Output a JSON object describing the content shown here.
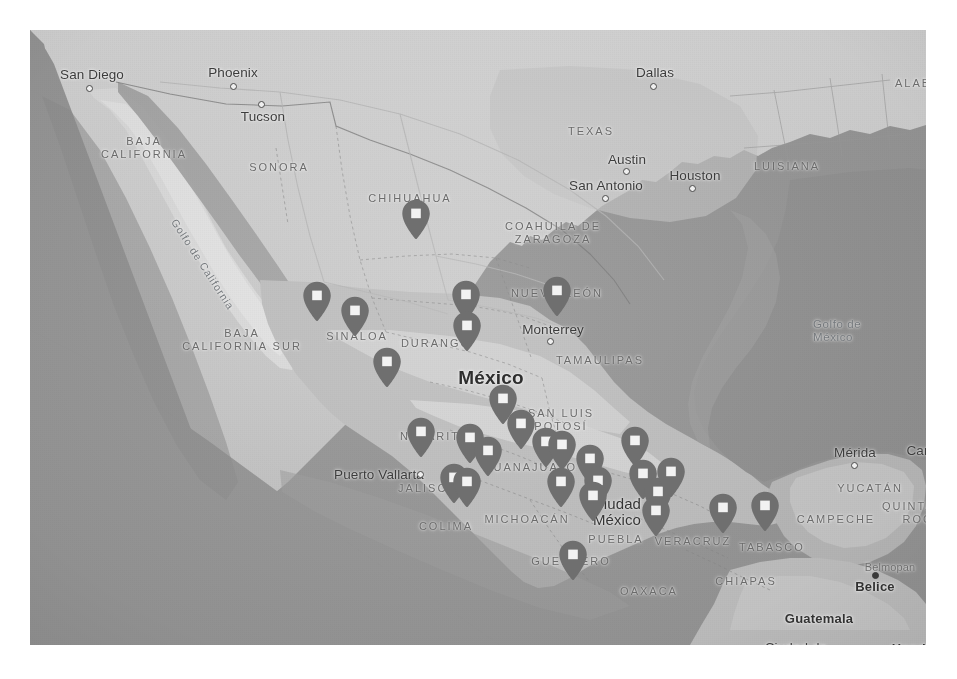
{
  "view": {
    "background": "#ffffff",
    "map_bounds": {
      "left": 30,
      "top": 30,
      "width": 896,
      "height": 615
    },
    "ocean_color": "#999999",
    "land_color": "#c9c9c9",
    "land_light_color": "#dcdcdc",
    "marker_color": "#6f6f6f",
    "marker_inner_color": "#f2f2f2"
  },
  "map": {
    "title": "Mexico locations map",
    "country_focus": "México",
    "water_labels": [
      {
        "name": "gulf-of-california",
        "text": "Golfo de California",
        "x": 150,
        "y": 186,
        "rotated": true
      },
      {
        "name": "gulf-of-mexico-line1",
        "text": "Golfo de",
        "x": 783,
        "y": 287,
        "rotated": false
      },
      {
        "name": "gulf-of-mexico-line2",
        "text": "México",
        "x": 783,
        "y": 300,
        "rotated": false
      }
    ],
    "country_labels": [
      {
        "name": "country-belize",
        "text": "Belice",
        "x": 845,
        "y": 556
      },
      {
        "name": "country-guatemala",
        "text": "Guatemala",
        "x": 789,
        "y": 588
      },
      {
        "name": "country-honduras",
        "text": "Honduras",
        "x": 893,
        "y": 618
      }
    ],
    "country_focus_label": {
      "name": "country-mexico",
      "text": "México",
      "x": 461,
      "y": 348
    },
    "state_labels": [
      {
        "name": "state-baja-california",
        "lines": [
          "BAJA",
          "CALIFORNIA"
        ],
        "x": 114,
        "y": 118
      },
      {
        "name": "state-sonora",
        "lines": [
          "SONORA"
        ],
        "x": 249,
        "y": 137
      },
      {
        "name": "state-chihuahua",
        "lines": [
          "CHIHUAHUA"
        ],
        "x": 380,
        "y": 168
      },
      {
        "name": "state-coahuila-de-zaragoza",
        "lines": [
          "COAHUILA DE",
          "ZARAGOZA"
        ],
        "x": 523,
        "y": 203
      },
      {
        "name": "state-nuevo-leon",
        "lines": [
          "NUEVO LEÓN"
        ],
        "x": 527,
        "y": 263
      },
      {
        "name": "state-baja-california-sur",
        "lines": [
          "BAJA",
          "CALIFORNIA SUR"
        ],
        "x": 212,
        "y": 310
      },
      {
        "name": "state-sinaloa",
        "lines": [
          "SINALOA"
        ],
        "x": 327,
        "y": 306
      },
      {
        "name": "state-durango",
        "lines": [
          "DURANGO"
        ],
        "x": 406,
        "y": 313
      },
      {
        "name": "state-tamaulipas",
        "lines": [
          "TAMAULIPAS"
        ],
        "x": 570,
        "y": 330
      },
      {
        "name": "state-nayarit",
        "lines": [
          "NAYARIT"
        ],
        "x": 400,
        "y": 406
      },
      {
        "name": "state-san-luis-potosi",
        "lines": [
          "SAN LUIS",
          "POTOSÍ"
        ],
        "x": 531,
        "y": 390
      },
      {
        "name": "state-guanajuato",
        "lines": [
          "GUANAJUATO"
        ],
        "x": 500,
        "y": 437
      },
      {
        "name": "state-jalisco",
        "lines": [
          "JALISCO"
        ],
        "x": 398,
        "y": 458
      },
      {
        "name": "state-colima",
        "lines": [
          "COLIMA"
        ],
        "x": 416,
        "y": 496
      },
      {
        "name": "state-michoacan",
        "lines": [
          "MICHOACÁN"
        ],
        "x": 497,
        "y": 489
      },
      {
        "name": "state-puebla",
        "lines": [
          "PUEBLA"
        ],
        "x": 586,
        "y": 509
      },
      {
        "name": "state-veracruz",
        "lines": [
          "VERACRUZ"
        ],
        "x": 663,
        "y": 511
      },
      {
        "name": "state-tabasco",
        "lines": [
          "TABASCO"
        ],
        "x": 742,
        "y": 517
      },
      {
        "name": "state-guerrero",
        "lines": [
          "GUERRERO"
        ],
        "x": 541,
        "y": 531
      },
      {
        "name": "state-oaxaca",
        "lines": [
          "OAXACA"
        ],
        "x": 619,
        "y": 561
      },
      {
        "name": "state-chiapas",
        "lines": [
          "CHIAPAS"
        ],
        "x": 716,
        "y": 551
      },
      {
        "name": "state-campeche",
        "lines": [
          "CAMPECHE"
        ],
        "x": 806,
        "y": 489
      },
      {
        "name": "state-yucatan",
        "lines": [
          "YUCATÁN"
        ],
        "x": 840,
        "y": 458
      },
      {
        "name": "state-quintana-roo",
        "lines": [
          "QUINTANA",
          "ROO"
        ],
        "x": 888,
        "y": 483
      },
      {
        "name": "state-texas",
        "lines": [
          "TEXAS"
        ],
        "x": 561,
        "y": 101
      },
      {
        "name": "state-luisiana",
        "lines": [
          "LUISIANA"
        ],
        "x": 757,
        "y": 136
      },
      {
        "name": "state-alabama",
        "lines": [
          "ALABAMA"
        ],
        "x": 898,
        "y": 53
      }
    ],
    "city_labels": [
      {
        "name": "city-san-diego",
        "text": "San Diego",
        "x": 62,
        "y": 44,
        "dot_x": 59,
        "dot_y": 58,
        "size": "city"
      },
      {
        "name": "city-phoenix",
        "text": "Phoenix",
        "x": 203,
        "y": 42,
        "dot_x": 203,
        "dot_y": 56,
        "size": "city"
      },
      {
        "name": "city-tucson",
        "text": "Tucson",
        "x": 233,
        "y": 86,
        "dot_x": 231,
        "dot_y": 74,
        "size": "city"
      },
      {
        "name": "city-dallas",
        "text": "Dallas",
        "x": 625,
        "y": 42,
        "dot_x": 623,
        "dot_y": 56,
        "size": "city"
      },
      {
        "name": "city-austin",
        "text": "Austin",
        "x": 597,
        "y": 129,
        "dot_x": 596,
        "dot_y": 141,
        "size": "city"
      },
      {
        "name": "city-san-antonio",
        "text": "San Antonio",
        "x": 576,
        "y": 155,
        "dot_x": 575,
        "dot_y": 168,
        "size": "city"
      },
      {
        "name": "city-houston",
        "text": "Houston",
        "x": 665,
        "y": 145,
        "dot_x": 662,
        "dot_y": 158,
        "size": "city"
      },
      {
        "name": "city-monterrey",
        "text": "Monterrey",
        "x": 523,
        "y": 299,
        "dot_x": 520,
        "dot_y": 311,
        "size": "city"
      },
      {
        "name": "city-puerto-vallarta",
        "text": "Puerto Vallarta",
        "x": 349,
        "y": 444,
        "dot_x": 390,
        "dot_y": 444,
        "size": "city"
      },
      {
        "name": "city-merida",
        "text": "Mérida",
        "x": 825,
        "y": 422,
        "dot_x": 824,
        "dot_y": 435,
        "size": "city"
      },
      {
        "name": "city-cancun",
        "text": "Cancún",
        "x": 900,
        "y": 420,
        "dot_x": 899,
        "dot_y": 432,
        "size": "city"
      },
      {
        "name": "city-belmopan",
        "text": "Belmopan",
        "x": 860,
        "y": 537,
        "dot_x": 845,
        "dot_y": 545,
        "size": "small-faint"
      },
      {
        "name": "city-ciudad-de-mexico-l1",
        "text": "Ciudad",
        "x": 587,
        "y": 473,
        "size": "city-mid"
      },
      {
        "name": "city-ciudad-de-mexico-l2",
        "text": "México",
        "x": 587,
        "y": 489,
        "size": "city-mid"
      },
      {
        "name": "city-ciudad-de-guatemala-l1",
        "text": "Ciudad de",
        "x": 766,
        "y": 617,
        "size": "city"
      },
      {
        "name": "city-ciudad-de-guatemala-l2",
        "text": "Guatemala",
        "x": 766,
        "y": 633,
        "size": "city"
      }
    ],
    "markers": [
      {
        "name": "map-marker",
        "id": 1,
        "x": 386,
        "y": 210,
        "region": "Chihuahua"
      },
      {
        "name": "map-marker",
        "id": 2,
        "x": 287,
        "y": 292,
        "region": "Sinaloa-north"
      },
      {
        "name": "map-marker",
        "id": 3,
        "x": 436,
        "y": 291,
        "region": "Durango-east"
      },
      {
        "name": "map-marker",
        "id": 4,
        "x": 527,
        "y": 287,
        "region": "Monterrey"
      },
      {
        "name": "map-marker",
        "id": 5,
        "x": 325,
        "y": 307,
        "region": "Sinaloa"
      },
      {
        "name": "map-marker",
        "id": 6,
        "x": 437,
        "y": 322,
        "region": "Durango"
      },
      {
        "name": "map-marker",
        "id": 7,
        "x": 357,
        "y": 358,
        "region": "Sinaloa-south"
      },
      {
        "name": "map-marker",
        "id": 8,
        "x": 473,
        "y": 395,
        "region": "Zacatecas"
      },
      {
        "name": "map-marker",
        "id": 9,
        "x": 491,
        "y": 420,
        "region": "San Luis Potosí"
      },
      {
        "name": "map-marker",
        "id": 10,
        "x": 391,
        "y": 428,
        "region": "Nayarit"
      },
      {
        "name": "map-marker",
        "id": 11,
        "x": 440,
        "y": 434,
        "region": "Jalisco-north"
      },
      {
        "name": "map-marker",
        "id": 12,
        "x": 458,
        "y": 447,
        "region": "Guanajuato-west"
      },
      {
        "name": "map-marker",
        "id": 13,
        "x": 516,
        "y": 438,
        "region": "Guanajuato"
      },
      {
        "name": "map-marker",
        "id": 14,
        "x": 532,
        "y": 441,
        "region": "Guanajuato-east"
      },
      {
        "name": "map-marker",
        "id": 15,
        "x": 605,
        "y": 437,
        "region": "Hidalgo"
      },
      {
        "name": "map-marker",
        "id": 16,
        "x": 424,
        "y": 474,
        "region": "Jalisco"
      },
      {
        "name": "map-marker",
        "id": 17,
        "x": 437,
        "y": 478,
        "region": "Colima"
      },
      {
        "name": "map-marker",
        "id": 18,
        "x": 531,
        "y": 478,
        "region": "Michoacán"
      },
      {
        "name": "map-marker",
        "id": 19,
        "x": 560,
        "y": 455,
        "region": "Querétaro"
      },
      {
        "name": "map-marker",
        "id": 20,
        "x": 568,
        "y": 477,
        "region": "Estado de México"
      },
      {
        "name": "map-marker",
        "id": 21,
        "x": 563,
        "y": 492,
        "region": "CDMX-south"
      },
      {
        "name": "map-marker",
        "id": 22,
        "x": 613,
        "y": 470,
        "region": "Puebla-north"
      },
      {
        "name": "map-marker",
        "id": 23,
        "x": 628,
        "y": 488,
        "region": "Puebla"
      },
      {
        "name": "map-marker",
        "id": 24,
        "x": 641,
        "y": 468,
        "region": "Veracruz-north"
      },
      {
        "name": "map-marker",
        "id": 25,
        "x": 626,
        "y": 507,
        "region": "Veracruz-city"
      },
      {
        "name": "map-marker",
        "id": 26,
        "x": 693,
        "y": 504,
        "region": "Veracruz-south"
      },
      {
        "name": "map-marker",
        "id": 27,
        "x": 735,
        "y": 502,
        "region": "Tabasco"
      },
      {
        "name": "map-marker",
        "id": 28,
        "x": 543,
        "y": 551,
        "region": "Guerrero"
      }
    ]
  }
}
